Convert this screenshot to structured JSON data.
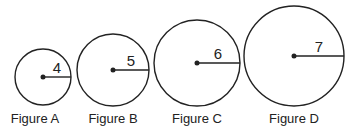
{
  "figures": [
    {
      "label": "Figure A",
      "radius_label": "4",
      "cx": 43,
      "cy": 77,
      "r": 28
    },
    {
      "label": "Figure B",
      "radius_label": "5",
      "cx": 113,
      "cy": 70,
      "r": 36
    },
    {
      "label": "Figure C",
      "radius_label": "6",
      "cx": 197,
      "cy": 63,
      "r": 43
    },
    {
      "label": "Figure D",
      "radius_label": "7",
      "cx": 294,
      "cy": 56,
      "r": 50
    }
  ],
  "colors": {
    "stroke": "#222222",
    "background": "#ffffff"
  }
}
